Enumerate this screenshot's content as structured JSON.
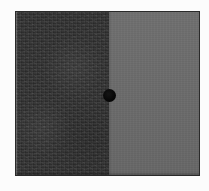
{
  "image": {
    "title": "Two-tone panel with centered black dot",
    "width": 209,
    "height": 191,
    "background_color": "#fcfcfc"
  },
  "panel": {
    "name": "split-panel",
    "border_color": "#2a2a2a",
    "left_region": {
      "label": "dark textured region",
      "color": "#2f2f2f",
      "texture": "fabric-grain-noise",
      "width_fraction": 0.508
    },
    "right_region": {
      "label": "flat gray region",
      "color": "#6b6b6b",
      "texture": "smooth-fine-noise",
      "width_fraction": 0.492
    },
    "seam": {
      "label": "vertical boundary",
      "x": 109
    }
  },
  "marker": {
    "label": "center dot",
    "shape": "circle",
    "color": "#000000",
    "diameter": 13,
    "center_x": 109,
    "center_y": 95
  }
}
